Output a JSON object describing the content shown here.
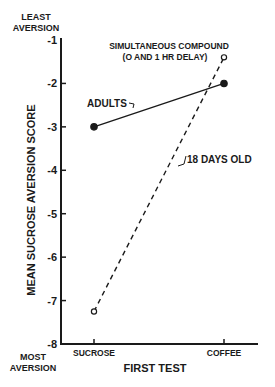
{
  "chart_data": {
    "type": "line",
    "title": "",
    "xlabel": "FIRST TEST",
    "ylabel": "MEAN SUCROSE AVERSION SCORE",
    "categories": [
      "SUCROSE",
      "COFFEE"
    ],
    "yticks": [
      -1,
      -2,
      -3,
      -4,
      -5,
      -6,
      -7,
      -8
    ],
    "ytick_labels": [
      "-1",
      "-2",
      "-3",
      "-4",
      "-5",
      "-6",
      "-7",
      "-8"
    ],
    "ylim": [
      -8,
      -1
    ],
    "grid": false,
    "y_top_label": [
      "LEAST",
      "AVERSION"
    ],
    "y_bottom_label": [
      "MOST",
      "AVERSION"
    ],
    "series": [
      {
        "name": "ADULTS",
        "style": "solid",
        "marker": "filled-circle",
        "values": [
          -3.0,
          -2.0
        ]
      },
      {
        "name": "18 DAYS OLD",
        "style": "dashed",
        "marker": "open-circle",
        "values": [
          -7.25,
          -1.4
        ]
      }
    ],
    "annotations": [
      {
        "text": [
          "SIMULTANEOUS COMPOUND",
          "(O AND 1 HR DELAY)"
        ]
      }
    ]
  }
}
